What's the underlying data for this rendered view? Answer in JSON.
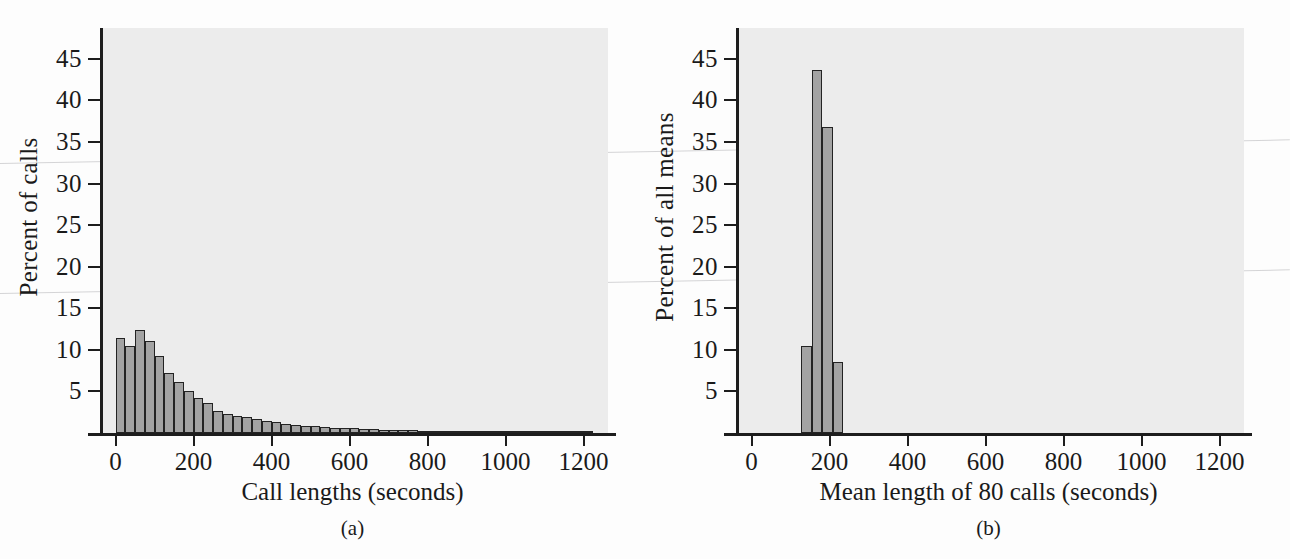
{
  "figure": {
    "caption_a": "(a)",
    "caption_b": "(b)",
    "bar_fill": "#a3a3a3",
    "bar_stroke": "#232323",
    "plot_bg": "#ececec",
    "axis_color": "#1d1d1d",
    "page_bg": "#fdfdfd"
  },
  "chart_data": [
    {
      "type": "bar",
      "panel": "(a)",
      "title": "",
      "xlabel": "Call lengths (seconds)",
      "ylabel": "Percent of calls",
      "xlim": [
        -40,
        1255
      ],
      "ylim": [
        0,
        48.7
      ],
      "xticks": [
        0,
        200,
        400,
        600,
        800,
        1000,
        1200
      ],
      "xtick_labels": [
        "0",
        "200",
        "400",
        "600",
        "800",
        "1000",
        "1200"
      ],
      "yticks": [
        5,
        10,
        15,
        20,
        25,
        30,
        35,
        40,
        45
      ],
      "ytick_labels": [
        "5",
        "10",
        "15",
        "20",
        "25",
        "30",
        "35",
        "40",
        "45"
      ],
      "grid": false,
      "legend": "none",
      "bin_width": 25,
      "bin_starts": [
        0,
        25,
        50,
        75,
        100,
        125,
        150,
        175,
        200,
        225,
        250,
        275,
        300,
        325,
        350,
        375,
        400,
        425,
        450,
        475,
        500,
        525,
        550,
        575,
        600,
        625,
        650,
        675,
        700,
        725,
        750,
        775,
        800,
        825,
        850,
        875,
        900,
        925,
        950,
        975,
        1000,
        1025,
        1050,
        1075,
        1100,
        1125,
        1150,
        1175,
        1200
      ],
      "categories": [
        "0-25",
        "25-50",
        "50-75",
        "75-100",
        "100-125",
        "125-150",
        "150-175",
        "175-200",
        "200-225",
        "225-250",
        "250-275",
        "275-300",
        "300-325",
        "325-350",
        "350-375",
        "375-400",
        "400-425",
        "425-450",
        "450-475",
        "475-500",
        "500-525",
        "525-550",
        "550-575",
        "575-600",
        "600-625",
        "625-650",
        "650-675",
        "675-700",
        "700-725",
        "725-750",
        "750-775",
        "775-800",
        "800-825",
        "825-850",
        "850-875",
        "875-900",
        "900-925",
        "925-950",
        "950-975",
        "975-1000",
        "1000-1025",
        "1025-1050",
        "1050-1075",
        "1075-1100",
        "1100-1125",
        "1125-1150",
        "1150-1175",
        "1175-1200",
        "1200-1225"
      ],
      "values": [
        11.4,
        10.5,
        12.4,
        11.1,
        9.3,
        7.2,
        6.1,
        5.0,
        4.2,
        3.6,
        2.6,
        2.3,
        2.1,
        1.9,
        1.7,
        1.5,
        1.3,
        1.1,
        1.0,
        0.9,
        0.8,
        0.7,
        0.65,
        0.6,
        0.55,
        0.5,
        0.45,
        0.4,
        0.37,
        0.34,
        0.31,
        0.29,
        0.27,
        0.25,
        0.23,
        0.21,
        0.2,
        0.19,
        0.18,
        0.17,
        0.16,
        0.15,
        0.14,
        0.13,
        0.12,
        0.11,
        0.1,
        0.1,
        0.09
      ]
    },
    {
      "type": "bar",
      "panel": "(b)",
      "title": "",
      "xlabel": "Mean length of 80 calls (seconds)",
      "ylabel": "Percent of all means",
      "xlim": [
        -40,
        1255
      ],
      "ylim": [
        0,
        48.7
      ],
      "xticks": [
        0,
        200,
        400,
        600,
        800,
        1000,
        1200
      ],
      "xtick_labels": [
        "0",
        "200",
        "400",
        "600",
        "800",
        "1000",
        "1200"
      ],
      "yticks": [
        5,
        10,
        15,
        20,
        25,
        30,
        35,
        40,
        45
      ],
      "ytick_labels": [
        "5",
        "10",
        "15",
        "20",
        "25",
        "30",
        "35",
        "40",
        "45"
      ],
      "grid": false,
      "legend": "none",
      "bin_width": 27,
      "bin_starts": [
        127,
        154,
        181,
        208
      ],
      "categories": [
        "127-154",
        "154-181",
        "181-208",
        "208-235"
      ],
      "values": [
        10.5,
        43.7,
        36.8,
        8.5
      ]
    }
  ]
}
